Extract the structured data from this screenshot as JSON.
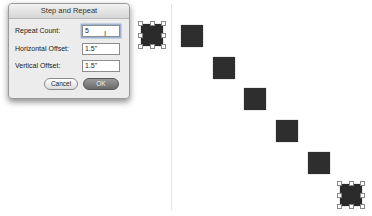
{
  "dialog": {
    "title": "Step and Repeat",
    "fields": [
      {
        "label": "Repeat Count:",
        "value": "5"
      },
      {
        "label": "Horizontal Offset:",
        "value": "1.5\""
      },
      {
        "label": "Vertical Offset:",
        "value": "1.5\""
      }
    ],
    "buttons": {
      "cancel": "Cancel",
      "ok": "OK"
    },
    "cursor_glyph": "I"
  },
  "canvas": {
    "square_color": "#2e2e2e",
    "original_selected": {
      "x": 141,
      "y": 24
    },
    "copies": [
      {
        "x": 181,
        "y": 25
      },
      {
        "x": 213,
        "y": 57
      },
      {
        "x": 244,
        "y": 88
      },
      {
        "x": 276,
        "y": 120
      },
      {
        "x": 308,
        "y": 152
      },
      {
        "x": 340,
        "y": 184
      }
    ]
  }
}
